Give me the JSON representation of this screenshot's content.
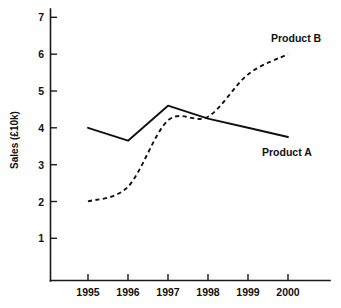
{
  "chart_data": {
    "type": "line",
    "title": "",
    "xlabel": "",
    "ylabel": "Sales  (£10k)",
    "categories": [
      "1995",
      "1996",
      "1997",
      "1998",
      "1999",
      "2000"
    ],
    "x": [
      1995,
      1996,
      1997,
      1998,
      1999,
      2000
    ],
    "xlim": [
      1994.6,
      2000.7
    ],
    "ylim": [
      0,
      7.35
    ],
    "yticks": [
      1,
      2,
      3,
      4,
      5,
      6,
      7
    ],
    "yticklabels": [
      "1",
      "2",
      "3",
      "4",
      "5",
      "6",
      "7"
    ],
    "xticklabels": [
      "1995",
      "1996",
      "1997",
      "1998",
      "1999",
      "2000"
    ],
    "grid": false,
    "legend": "inline-annotations",
    "series": [
      {
        "name": "Product A",
        "style": "solid",
        "color": "#111111",
        "values": [
          4.0,
          3.65,
          4.6,
          4.25,
          4.0,
          3.75
        ],
        "label_text": "Product A"
      },
      {
        "name": "Product B",
        "style": "dashed",
        "color": "#111111",
        "values": [
          2.0,
          2.4,
          4.2,
          4.3,
          5.45,
          6.0
        ],
        "label_text": "Product B"
      }
    ],
    "annotations": [
      {
        "text": "Product B",
        "at_x": 1999.6,
        "at_y": 6.45
      },
      {
        "text": "Product A",
        "at_x": 1999.6,
        "at_y": 3.35
      }
    ]
  },
  "axes": {
    "y_axis_title": "Sales  (£10k)",
    "y_labels": [
      "7",
      "6",
      "5",
      "4",
      "3",
      "2",
      "1"
    ],
    "x_labels": [
      "1995",
      "1996",
      "1997",
      "1998",
      "1999",
      "2000"
    ]
  },
  "labels": {
    "product_a": "Product A",
    "product_b": "Product B"
  },
  "colors": {
    "ink": "#111111",
    "background": "#ffffff"
  }
}
